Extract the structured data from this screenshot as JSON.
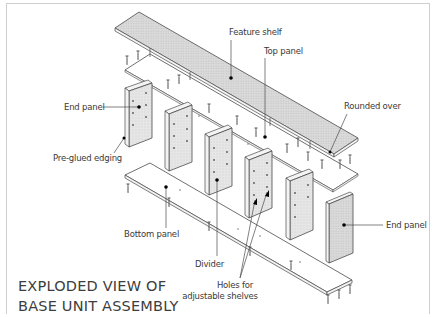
{
  "title": {
    "line1": "EXPLODED VIEW OF",
    "line2": "BASE UNIT ASSEMBLY"
  },
  "labels": {
    "feature_shelf": "Feature shelf",
    "top_panel": "Top panel",
    "rounded_over": "Rounded over",
    "end_panel_left": "End panel",
    "pre_glued_edging": "Pre-glued edging",
    "bottom_panel": "Bottom panel",
    "divider": "Divider",
    "holes_line1": "Holes for",
    "holes_line2": "adjustable shelves",
    "end_panel_right": "End panel"
  },
  "colors": {
    "line": "#4a4a4a",
    "panel_fill": "#e9e9e9",
    "shelf_fill": "#dcdcdc",
    "frame": "#cfcfcf",
    "text": "#3a3a3a"
  },
  "parts": [
    "Feature shelf",
    "Top panel",
    "End panel",
    "Divider",
    "Divider",
    "Divider",
    "Divider",
    "End panel",
    "Bottom panel"
  ]
}
